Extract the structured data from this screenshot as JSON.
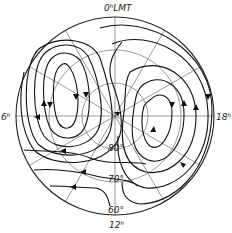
{
  "diagram": {
    "type": "polar convection pattern",
    "center": {
      "x": 115,
      "y": 116
    },
    "outer_radius": 99,
    "labels": {
      "top": "0ʰLMT",
      "left": "6ʰ",
      "right": "18ʰ",
      "bottom": "12ʰ"
    },
    "latitude_circles": [
      {
        "label": "80°",
        "radius": 33
      },
      {
        "label": "70°",
        "radius": 66
      },
      {
        "label": "60°",
        "radius": 99
      }
    ],
    "colors": {
      "line": "#111111",
      "grid": "#555555",
      "background": "#ffffff"
    }
  }
}
